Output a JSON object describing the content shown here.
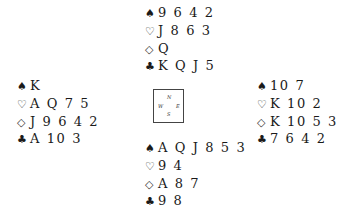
{
  "diagram": {
    "type": "bridge-deal",
    "suit_symbols": {
      "spades": "♠",
      "hearts": "♡",
      "diamonds": "◇",
      "clubs": "♣"
    },
    "hands": {
      "north": {
        "spades": "9 6 4 2",
        "hearts": "J 8 6 3",
        "diamonds": "Q",
        "clubs": "K Q J 5"
      },
      "west": {
        "spades": "K",
        "hearts": "A Q 7 5",
        "diamonds": "J 9 6 4 2",
        "clubs": "A 10 3"
      },
      "east": {
        "spades": "10 7",
        "hearts": "K 10 2",
        "diamonds": "K 10 5 3",
        "clubs": "7 6 4 2"
      },
      "south": {
        "spades": "A Q J 8 5 3",
        "hearts": "9 4",
        "diamonds": "A 8 7",
        "clubs": "9 8"
      }
    },
    "compass": {
      "n": "N",
      "s": "S",
      "w": "W",
      "e": "E"
    }
  }
}
